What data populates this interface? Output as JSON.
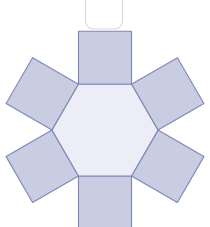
{
  "figure": {
    "background_color": "#ffffff",
    "width": 210,
    "height": 227
  },
  "palette": {
    "square_fill": "#c9cde2",
    "hexagon_fill": "#ecedf7",
    "stroke": "#7f86b6",
    "stroke_width": 1.1,
    "rounded_rect_stroke": "#dadada",
    "rounded_rect_fill": "#ffffff"
  },
  "shapes": {
    "rounded_rect": {
      "name": "rounded-rectangle-outline",
      "x": 85.5,
      "y": -16,
      "width": 37,
      "height": 45,
      "radius": 8
    },
    "hexagon": {
      "name": "central-hexagon-face",
      "orientation": "flat-top",
      "center_x": 105,
      "center_y": 131,
      "circumradius": 54,
      "points": "78.5,84.2 131.5,84.2 158,130.1 131.5,176.0 78.5,176.0 52,130.1"
    },
    "squares": [
      {
        "name": "square-face-top",
        "edge_index": 0,
        "angle_deg": 0,
        "points": "78.5,84.2 131.5,84.2 131.5,31.2 78.5,31.2"
      },
      {
        "name": "square-face-upper-right",
        "edge_index": 1,
        "angle_deg": 60,
        "points": "131.5,84.2 158,130.1 203.9,103.6 177.4,57.7"
      },
      {
        "name": "square-face-lower-right",
        "edge_index": 2,
        "angle_deg": 120,
        "points": "158,130.1 131.5,176.0 177.4,202.5 203.9,156.6"
      },
      {
        "name": "square-face-bottom",
        "edge_index": 3,
        "angle_deg": 180,
        "points": "131.5,176.0 78.5,176.0 78.5,229.0 131.5,229.0"
      },
      {
        "name": "square-face-lower-left",
        "edge_index": 4,
        "angle_deg": 240,
        "points": "78.5,176.0 52,130.1 6.1,156.6 32.6,202.5"
      },
      {
        "name": "square-face-upper-left",
        "edge_index": 5,
        "angle_deg": 300,
        "points": "52,130.1 78.5,84.2 32.6,57.7 6.1,103.6"
      }
    ]
  }
}
